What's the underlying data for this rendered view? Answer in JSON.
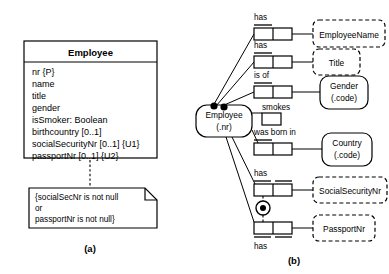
{
  "figure": {
    "caption_a": "(a)",
    "caption_b": "(b)"
  },
  "uml": {
    "class_name": "Employee",
    "attributes": [
      "nr {P}",
      "name",
      "title",
      "gender",
      "isSmoker: Boolean",
      "birthcountry [0..1]",
      "socialSecurityNr [0..1] {U1}",
      "passportNr [0..1] {U2}"
    ],
    "note": {
      "lines": [
        "{socialSecNr is not null",
        "or",
        "passportNr is not null}"
      ]
    }
  },
  "orm": {
    "entity": {
      "label_line1": "Employee",
      "label_line2": "(.nr)"
    },
    "fact_types": [
      {
        "predicate": "has",
        "object": "EmployeeName",
        "object_kind": "value-type",
        "label_position": "above",
        "roles": 2,
        "uniqueness": "spanning-above"
      },
      {
        "predicate": "has",
        "object": "Title",
        "object_kind": "value-type",
        "label_position": "above",
        "roles": 2,
        "uniqueness": "spanning-above"
      },
      {
        "predicate": "is of",
        "object": "Gender (.code)",
        "object_line1": "Gender",
        "object_line2": "(.code)",
        "object_kind": "entity-type",
        "label_position": "above",
        "roles": 2,
        "uniqueness": "spanning-above"
      },
      {
        "predicate": "smokes",
        "object": "",
        "object_kind": "none",
        "label_position": "above",
        "roles": 1,
        "uniqueness": "none"
      },
      {
        "predicate": "was born in",
        "object": "Country (.code)",
        "object_line1": "Country",
        "object_line2": "(.code)",
        "object_kind": "entity-type",
        "label_position": "above",
        "roles": 2,
        "uniqueness": "spanning-above"
      },
      {
        "predicate": "has",
        "object": "SocialSecurityNr",
        "object_kind": "value-type",
        "label_position": "above",
        "roles": 2,
        "uniqueness": "per-role-above"
      },
      {
        "predicate": "has",
        "object": "PassportNr",
        "object_kind": "value-type",
        "label_position": "below",
        "roles": 2,
        "uniqueness": "per-role-below"
      }
    ],
    "constraints": {
      "inclusive_or": "inclusive-or-circle",
      "mandatory_dots": 2
    }
  },
  "colors": {
    "ink": "#000000",
    "paper": "#ffffff"
  }
}
